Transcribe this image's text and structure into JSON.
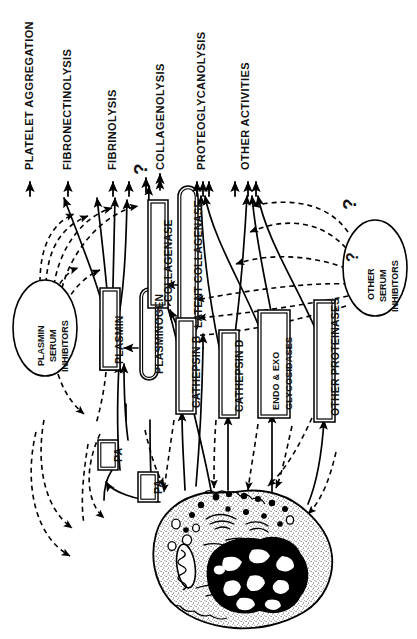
{
  "figure": {
    "orientation": "text rotated 90 degrees counter-clockwise",
    "colors": {
      "ink": "#000000",
      "paper": "#ffffff"
    }
  },
  "outcomes": [
    {
      "id": "platelet-aggregation",
      "label": "PLATELET AGGREGATION"
    },
    {
      "id": "fibronectinolysis",
      "label": "FIBRONECTINOLYSIS"
    },
    {
      "id": "fibrinolysis",
      "label": "FIBRINOLYSIS"
    },
    {
      "id": "collagenolysis",
      "label": "COLLAGENOLYSIS"
    },
    {
      "id": "proteoglycanolysis",
      "label": "PROTEOGLYCANOLYSIS"
    },
    {
      "id": "other-activities",
      "label": "OTHER ACTIVITIES"
    }
  ],
  "enzyme_boxes": [
    {
      "id": "plasmin",
      "label": "PLASMIN",
      "shape": "double-rect"
    },
    {
      "id": "plasminogen",
      "label": "PLASMINOGEN",
      "shape": "stadium"
    },
    {
      "id": "collagenase",
      "label": "COLLAGENASE",
      "shape": "double-rect"
    },
    {
      "id": "latent-collagenase",
      "label": "LATENT COLLAGENASE",
      "shape": "stadium"
    },
    {
      "id": "cathepsin-b",
      "label": "CATHEPSIN B",
      "shape": "double-rect"
    },
    {
      "id": "cathepsin-d",
      "label": "CATHEPSIN D",
      "shape": "double-rect"
    },
    {
      "id": "endo-exo-glycosidases",
      "label_line1": "ENDO & EXO",
      "label_line2": "GLYCOSIDASES",
      "shape": "double-rect"
    },
    {
      "id": "other-proteinases",
      "label": "OTHER PROTEINASES",
      "shape": "double-rect"
    },
    {
      "id": "pa-upper",
      "label": "PA",
      "shape": "double-rect"
    },
    {
      "id": "pa-lower",
      "label": "PA",
      "shape": "double-rect"
    }
  ],
  "inhibitors": [
    {
      "id": "plasmin-serum-inhibitors",
      "line1": "PLASMIN",
      "line2": "SERUM",
      "line3": "INHIBITORS",
      "shape": "ellipse"
    },
    {
      "id": "other-serum-inhibitors",
      "line1": "OTHER",
      "line2": "SERUM",
      "line3": "INHIBITORS",
      "shape": "ellipse"
    }
  ],
  "annotations": [
    {
      "id": "q-fibrinolysis-collagenolysis",
      "text": "?"
    },
    {
      "id": "q-other-inhibitors-upper",
      "text": "?"
    },
    {
      "id": "q-other-inhibitors-lower",
      "text": "?"
    }
  ],
  "cell": {
    "id": "macrophage",
    "description": "macrophage cell with lobed nucleus, mitochondrion, vacuoles and secretory granules"
  },
  "legend_semantics": {
    "solid_arrow": "activation / secretion / catalysis",
    "dashed_arrow": "inhibition / uncertain regulation"
  }
}
